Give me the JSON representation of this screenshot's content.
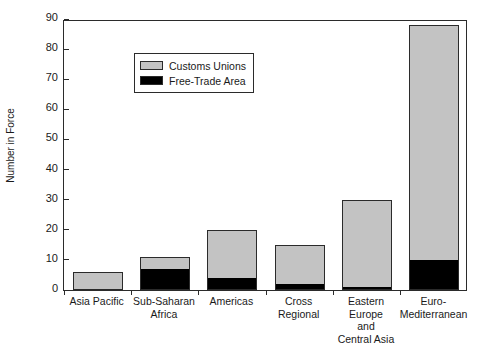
{
  "chart_data": {
    "type": "bar",
    "subtype": "stacked-vertical-bar",
    "title": "",
    "xlabel": "",
    "ylabel": "Number in Force",
    "ylim": [
      0,
      90
    ],
    "ytick_step": 10,
    "yticks": [
      "0",
      "10",
      "20",
      "30",
      "40",
      "50",
      "60",
      "70",
      "80",
      "90"
    ],
    "grid": false,
    "legend_position": "top-left inside plot",
    "categories": [
      "Asia Pacific",
      "Sub-Saharan\nAfrica",
      "Americas",
      "Cross\nRegional",
      "Eastern Europe\nand\nCentral Asia",
      "Euro-\nMediterranean"
    ],
    "series": [
      {
        "name": "Free-Trade Area",
        "color": "#000000",
        "values": [
          0,
          7,
          4,
          2,
          1,
          10
        ]
      },
      {
        "name": "Customs Unions",
        "color": "#c3c3c3",
        "values": [
          6,
          4,
          16,
          13,
          29,
          78
        ]
      }
    ],
    "totals": [
      6,
      11,
      20,
      15,
      30,
      88
    ]
  },
  "legend": {
    "items": [
      {
        "label": "Customs Unions",
        "swatch": "customs"
      },
      {
        "label": "Free-Trade Area",
        "swatch": "fta"
      }
    ]
  },
  "colors": {
    "customs_unions": "#c3c3c3",
    "free_trade_area": "#000000",
    "axis": "#2b2b2b",
    "background": "#ffffff"
  }
}
